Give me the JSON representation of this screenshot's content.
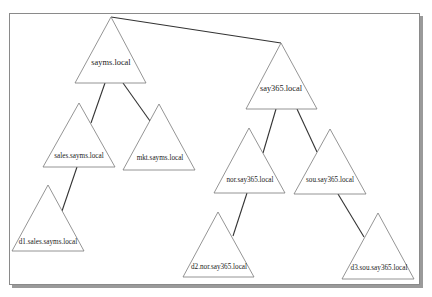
{
  "diagram": {
    "type": "domain-forest",
    "colors": {
      "background": "#ffffff",
      "frame_border": "#8a8a8a",
      "frame_shadow": "#9a9a9a",
      "triangle_stroke": "#7a7a7a",
      "edge": "#333333",
      "text": "#222222"
    },
    "nodes": [
      {
        "id": "sayms",
        "label": "sayms.local",
        "root": true
      },
      {
        "id": "say365",
        "label": "say365.local",
        "root": true
      },
      {
        "id": "sales",
        "label": "sales.sayms.local"
      },
      {
        "id": "mkt",
        "label": "mkt.sayms.local"
      },
      {
        "id": "nor",
        "label": "nor.say365.local"
      },
      {
        "id": "sou",
        "label": "sou.say365.local"
      },
      {
        "id": "d1",
        "label": "d1.sales.sayms.local"
      },
      {
        "id": "d2",
        "label": "d2.nor.say365.local"
      },
      {
        "id": "d3",
        "label": "d3.sou.say365.local"
      }
    ],
    "edges": [
      {
        "from": "sayms",
        "to": "say365"
      },
      {
        "from": "sayms",
        "to": "sales"
      },
      {
        "from": "sayms",
        "to": "mkt"
      },
      {
        "from": "say365",
        "to": "nor"
      },
      {
        "from": "say365",
        "to": "sou"
      },
      {
        "from": "sales",
        "to": "d1"
      },
      {
        "from": "nor",
        "to": "d2"
      },
      {
        "from": "sou",
        "to": "d3"
      }
    ]
  }
}
